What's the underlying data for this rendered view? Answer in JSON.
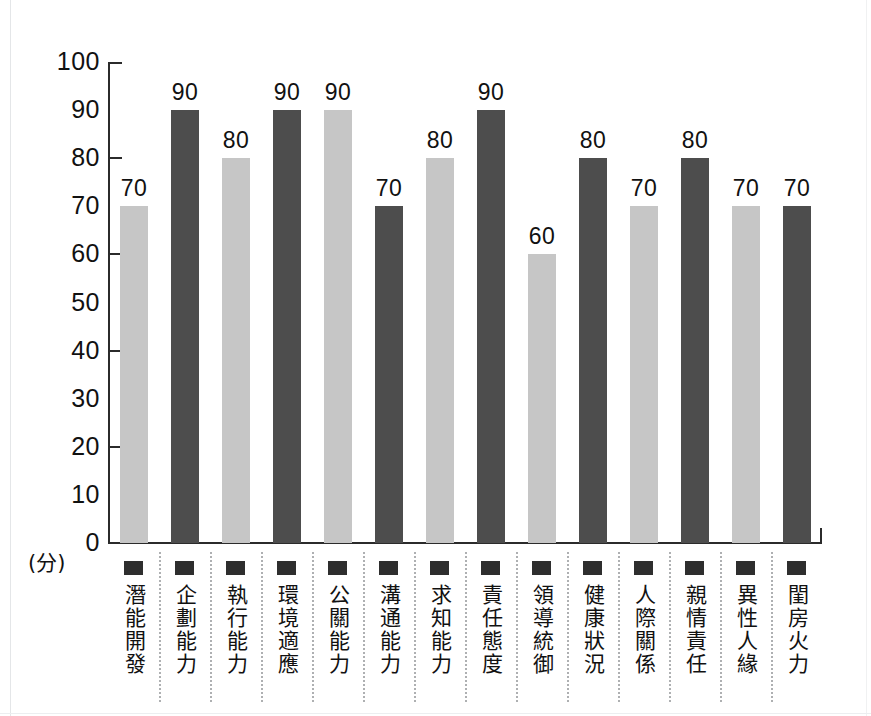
{
  "chart_data": {
    "type": "bar",
    "title": "",
    "xlabel": "",
    "ylabel": "",
    "y_unit_label": "(分)",
    "ylim": [
      0,
      100
    ],
    "yticks": [
      100,
      90,
      80,
      70,
      60,
      50,
      40,
      30,
      20,
      10,
      0
    ],
    "ytick_labels": [
      "100",
      "90",
      "80",
      "70",
      "60",
      "50",
      "40",
      "30",
      "20",
      "10",
      "0"
    ],
    "major_tick_values": [
      100,
      80,
      60,
      40,
      20,
      0
    ],
    "grid": false,
    "legend_position": "none",
    "categories": [
      "潛能開發",
      "企劃能力",
      "執行能力",
      "環境適應",
      "公關能力",
      "溝通能力",
      "求知能力",
      "責任態度",
      "領導統御",
      "健康狀況",
      "人際關係",
      "親情責任",
      "異性人緣",
      "閨房火力"
    ],
    "values": [
      70,
      90,
      80,
      90,
      90,
      70,
      80,
      90,
      60,
      80,
      70,
      80,
      70,
      70
    ],
    "value_labels": [
      "70",
      "90",
      "80",
      "90",
      "90",
      "70",
      "80",
      "90",
      "60",
      "80",
      "70",
      "80",
      "70",
      "70"
    ],
    "bar_colors": [
      "#c6c6c6",
      "#4d4d4d",
      "#c6c6c6",
      "#4d4d4d",
      "#c6c6c6",
      "#4d4d4d",
      "#c6c6c6",
      "#4d4d4d",
      "#c6c6c6",
      "#4d4d4d",
      "#c6c6c6",
      "#4d4d4d",
      "#c6c6c6",
      "#4d4d4d"
    ],
    "legend_swatch_color": "#2e2e2e",
    "axis_color": "#2b2b2b",
    "background_color": "#ffffff"
  }
}
